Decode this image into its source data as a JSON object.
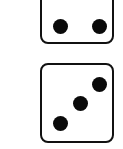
{
  "dice": [
    {
      "id": "top",
      "face_value": 2,
      "partially_visible": true
    },
    {
      "id": "bottom",
      "face_value": 3,
      "partially_visible": false
    }
  ],
  "colors": {
    "pip": "#0a0a0a",
    "border": "#111111",
    "face": "#ffffff"
  }
}
